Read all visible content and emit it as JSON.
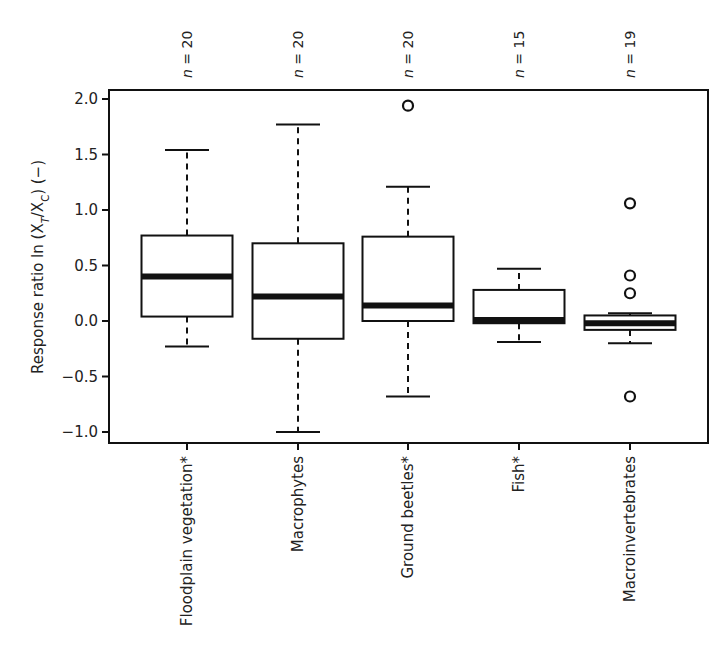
{
  "chart_data": {
    "type": "box",
    "title": "",
    "xlabel": "",
    "ylabel": "Response ratio ln (X̄T/X̄C) (−)",
    "ylabel_parts": {
      "prefix": "Response ratio ln (",
      "num": "X",
      "num_sub": "T",
      "slash": "/",
      "den": "X",
      "den_sub": "C",
      "suffix": ") (−)"
    },
    "ylim": [
      -1.1,
      2.1
    ],
    "yticks": [
      -1.0,
      -0.5,
      0.0,
      0.5,
      1.0,
      1.5,
      2.0
    ],
    "ytick_labels": [
      "−1.0",
      "−0.5",
      "0.0",
      "0.5",
      "1.0",
      "1.5",
      "2.0"
    ],
    "grid": false,
    "legend": null,
    "categories": [
      "Floodplain vegetation*",
      "Macrophytes",
      "Ground beetles*",
      "Fish*",
      "Macroinvertebrates"
    ],
    "n_labels": [
      "n = 20",
      "n = 20",
      "n = 20",
      "n = 15",
      "n = 19"
    ],
    "n_values": [
      20,
      20,
      20,
      15,
      19
    ],
    "boxes": [
      {
        "category": "Floodplain vegetation*",
        "whisker_low": -0.23,
        "q1": 0.04,
        "median": 0.4,
        "q3": 0.77,
        "whisker_high": 1.54,
        "outliers": []
      },
      {
        "category": "Macrophytes",
        "whisker_low": -1.0,
        "q1": -0.16,
        "median": 0.22,
        "q3": 0.7,
        "whisker_high": 1.77,
        "outliers": []
      },
      {
        "category": "Ground beetles*",
        "whisker_low": -0.68,
        "q1": 0.0,
        "median": 0.14,
        "q3": 0.76,
        "whisker_high": 1.21,
        "outliers": [
          1.94
        ]
      },
      {
        "category": "Fish*",
        "whisker_low": -0.19,
        "q1": -0.02,
        "median": 0.01,
        "q3": 0.28,
        "whisker_high": 0.47,
        "outliers": []
      },
      {
        "category": "Macroinvertebrates",
        "whisker_low": -0.2,
        "q1": -0.08,
        "median": -0.02,
        "q3": 0.05,
        "whisker_high": 0.07,
        "outliers": [
          1.06,
          0.41,
          0.25,
          -0.68
        ]
      }
    ],
    "annotations": [
      "* marks significant response"
    ]
  },
  "colors": {
    "stroke": "#111111",
    "box_fill": "#ffffff",
    "background": "#ffffff"
  }
}
